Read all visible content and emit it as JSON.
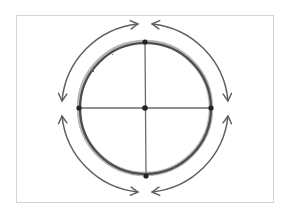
{
  "diagram": {
    "title": "",
    "frame": {
      "x": 16,
      "y": 15,
      "width": 258,
      "height": 188,
      "border_color": "#d4d4d4"
    },
    "circle": {
      "cx": 145,
      "cy": 108,
      "r": 66,
      "stroke_color": "#4a4a4a",
      "stroke_width": 3.5,
      "style": "pencil-sketch"
    },
    "crosshair": {
      "color": "#5a5a5a",
      "horizontal": {
        "x1": 79,
        "y1": 108,
        "x2": 211,
        "y2": 108
      },
      "vertical": {
        "x1": 145,
        "y1": 42,
        "x2": 146,
        "y2": 176
      }
    },
    "points": [
      {
        "name": "top",
        "x": 145,
        "y": 42
      },
      {
        "name": "bottom",
        "x": 146,
        "y": 176
      },
      {
        "name": "left",
        "x": 79,
        "y": 108
      },
      {
        "name": "right",
        "x": 211,
        "y": 108
      },
      {
        "name": "center",
        "x": 145,
        "y": 108
      }
    ],
    "point_color": "#222222",
    "arrows": {
      "color": "#5e5e5e",
      "radius": 85,
      "items": [
        {
          "name": "upper-left",
          "from": "left",
          "to": "top",
          "double_headed": true
        },
        {
          "name": "upper-right",
          "from": "top",
          "to": "right",
          "double_headed": true
        },
        {
          "name": "lower-left",
          "from": "left",
          "to": "bottom",
          "double_headed": true
        },
        {
          "name": "lower-right",
          "from": "bottom",
          "to": "right",
          "double_headed": true
        }
      ]
    }
  }
}
